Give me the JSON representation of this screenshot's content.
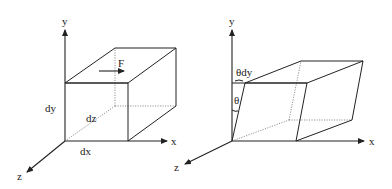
{
  "left_figure": {
    "name": "undeformed-element",
    "axes": {
      "x": "x",
      "y": "y",
      "z": "z"
    },
    "labels": {
      "force": "F",
      "dx": "dx",
      "dy": "dy",
      "dz": "dz"
    }
  },
  "right_figure": {
    "name": "sheared-element",
    "axes": {
      "x": "x",
      "y": "y",
      "z": "z"
    },
    "labels": {
      "theta_dy": "θdy",
      "theta": "θ"
    }
  },
  "colors": {
    "line": "#222222",
    "hidden_line": "#666666",
    "background": "#ffffff"
  }
}
